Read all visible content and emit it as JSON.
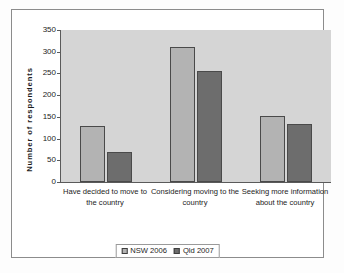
{
  "chart_data": {
    "type": "bar",
    "title": "",
    "xlabel": "",
    "ylabel": "Number of respondents",
    "ylim": [
      0,
      350
    ],
    "yticks": [
      0,
      50,
      100,
      150,
      200,
      250,
      300,
      350
    ],
    "grid": false,
    "legend_position": "bottom",
    "categories": [
      "Have decided to move to the country",
      "Considering moving to the country",
      "Seeking more information about the country"
    ],
    "category_lines": [
      [
        "Have decided to move to",
        "the country"
      ],
      [
        "Considering moving to the",
        "country"
      ],
      [
        "Seeking more information",
        "about the country"
      ]
    ],
    "series": [
      {
        "name": "NSW 2006",
        "color": "#b3b3b3",
        "values": [
          130,
          311,
          153
        ]
      },
      {
        "name": "Qld 2007",
        "color": "#6d6d6d",
        "values": [
          70,
          256,
          133
        ]
      }
    ]
  },
  "legend": {
    "items": [
      {
        "label": "NSW 2006"
      },
      {
        "label": "Qld 2007"
      }
    ]
  }
}
